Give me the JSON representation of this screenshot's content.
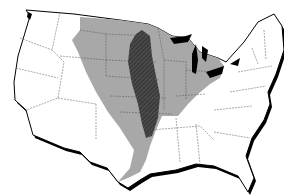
{
  "map": {
    "subject": "Contiguous United States with state boundaries",
    "background_color": "#ffffff",
    "land_color": "#ffffff",
    "outline_color": "#000000",
    "state_border_color": "#555555",
    "regions": [
      {
        "name": "broad-region",
        "description": "Wide gray region from the northern plains down through central states to the Gulf coast of Louisiana/Texas, eastward through Great Lakes and Ohio Valley",
        "fill": "#a8a8a8"
      },
      {
        "name": "core-band",
        "description": "Dark hatched north-south elongated band through the central plains/prairie (Minnesota/Dakotas down to Kansas/Oklahoma)",
        "fill": "#3a3a3a",
        "pattern": "diagonal-hatch"
      }
    ],
    "water_features": [
      "Great Lakes",
      "Puget Sound",
      "Chesapeake Bay"
    ]
  }
}
